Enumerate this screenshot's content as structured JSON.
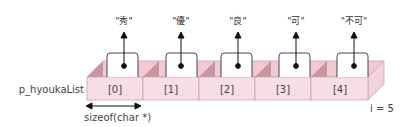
{
  "diagram": {
    "variable_name": "p_hyoukaList",
    "cells": [
      {
        "index": "[0]",
        "points_to": "\"秀\""
      },
      {
        "index": "[1]",
        "points_to": "\"優\""
      },
      {
        "index": "[2]",
        "points_to": "\"良\""
      },
      {
        "index": "[3]",
        "points_to": "\"可\""
      },
      {
        "index": "[4]",
        "points_to": "\"不可\""
      }
    ],
    "size_label": "sizeof(char *)",
    "count_label": "i = 5",
    "colors": {
      "cell_front": "#f6dde6",
      "cell_top": "#f0c8d6",
      "cell_shadow": "#c9959f",
      "cell_border": "#c8a6b0",
      "pointer_box": "#ffffff",
      "arrow": "#111111"
    }
  }
}
